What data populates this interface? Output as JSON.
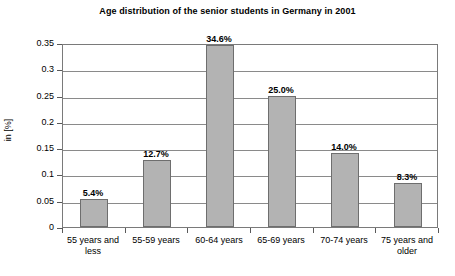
{
  "chart_data": {
    "type": "bar",
    "title": "Age distribution of the senior students in Germany in 2001",
    "xlabel": "",
    "ylabel": "in [%]",
    "categories": [
      "55 years and less",
      "55-59 years",
      "60-64 years",
      "65-69 years",
      "70-74 years",
      "75 years and older"
    ],
    "category_lines": [
      [
        "55 years and",
        "less"
      ],
      [
        "55-59 years",
        ""
      ],
      [
        "60-64 years",
        ""
      ],
      [
        "65-69 years",
        ""
      ],
      [
        "70-74 years",
        ""
      ],
      [
        "75 years and",
        "older"
      ]
    ],
    "values": [
      0.054,
      0.127,
      0.346,
      0.25,
      0.14,
      0.083
    ],
    "data_labels": [
      "5.4%",
      "12.7%",
      "34.6%",
      "25.0%",
      "14.0%",
      "8.3%"
    ],
    "ylim": [
      0,
      0.35
    ],
    "yticks": [
      0,
      0.05,
      0.1,
      0.15,
      0.2,
      0.25,
      0.3,
      0.35
    ],
    "ytick_labels": [
      "0",
      "0.05",
      "0.1",
      "0.15",
      "0.2",
      "0.25",
      "0.3",
      "0.35"
    ],
    "grid": true,
    "legend": "none",
    "bar_color": "#b3b3b3",
    "bar_border_color": "#6e6e6e",
    "axis_color": "#7a7a7a",
    "grid_color": "#8a8a8a"
  },
  "footer": {
    "note": ""
  }
}
